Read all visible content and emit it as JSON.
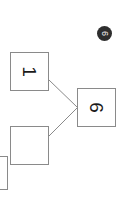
{
  "canvas": {
    "background_color": "#ffffff",
    "width": 122,
    "height": 207,
    "rotation_degrees": 90
  },
  "diagram": {
    "node_border_color": "#8a8a8a",
    "edge_color": "#8a8a8a",
    "nodes": [
      {
        "id": "node-one",
        "label": "1",
        "x": 10,
        "y": 52,
        "width": 39,
        "height": 39,
        "clipped": false
      },
      {
        "id": "node-empty",
        "label": "",
        "x": 10,
        "y": 126,
        "width": 39,
        "height": 39,
        "clipped": false
      },
      {
        "id": "node-six",
        "label": "6",
        "x": 77,
        "y": 88,
        "width": 39,
        "height": 39,
        "clipped": false
      },
      {
        "id": "node-clipped",
        "label": "",
        "x": -12,
        "y": 156,
        "width": 20,
        "height": 34,
        "clipped": true
      }
    ],
    "edges": [
      {
        "from": "node-one",
        "to": "node-six",
        "x1": 49,
        "y1": 80,
        "x2": 77,
        "y2": 107
      },
      {
        "from": "node-empty",
        "to": "node-six",
        "x1": 49,
        "y1": 136,
        "x2": 77,
        "y2": 108
      }
    ]
  },
  "badge": {
    "glyph": "6",
    "background_color": "#2e2e2e",
    "text_color": "#f2f2f2",
    "x": 97,
    "y": 26,
    "diameter": 15
  }
}
